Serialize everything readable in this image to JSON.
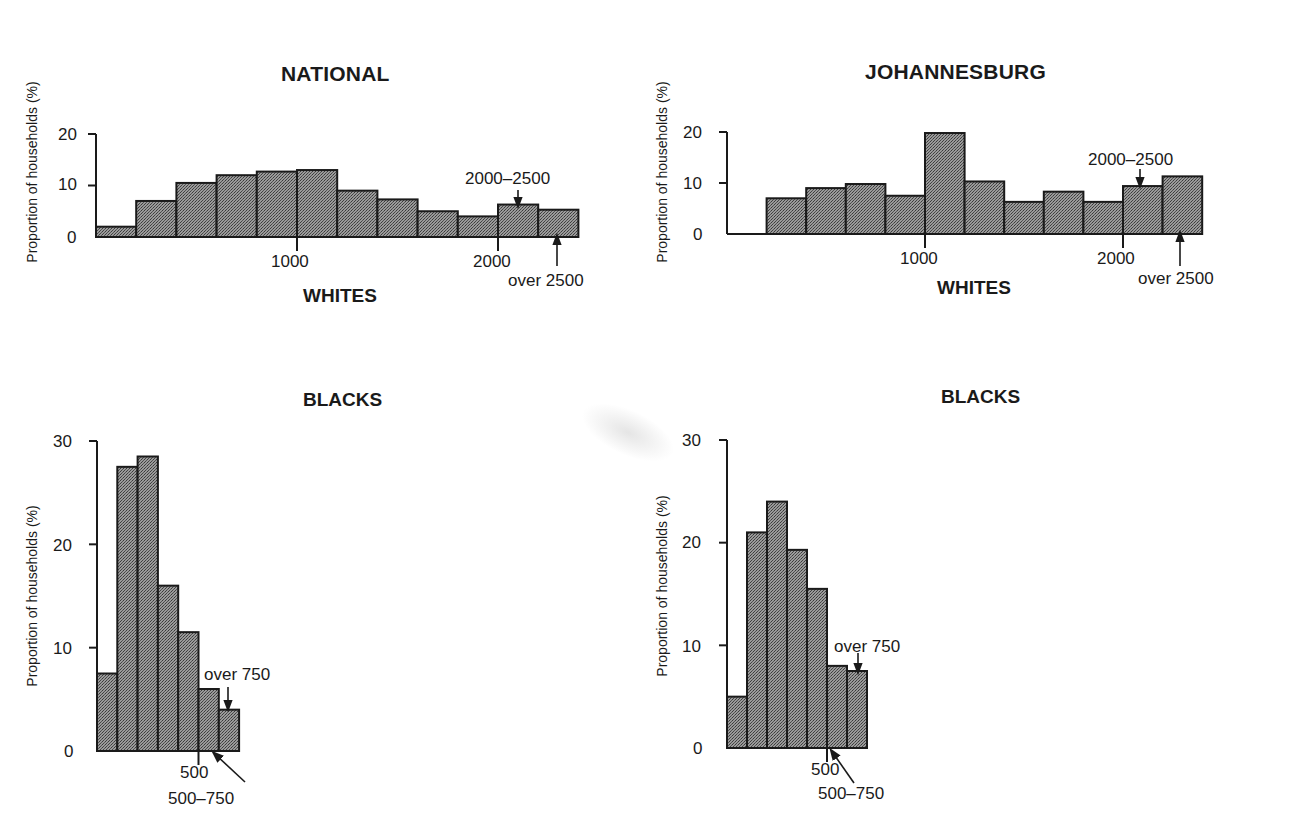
{
  "page": {
    "col_headers": {
      "national": "NATIONAL",
      "johannesburg": "JOHANNESBURG"
    },
    "ylabel": "Proportion of households (%)",
    "fill_color": "#8c8c8c",
    "line_color": "#1a1a1a"
  },
  "chart_data": [
    {
      "id": "national_whites",
      "type": "bar",
      "title": "NATIONAL",
      "xlabel": "WHITES",
      "ylabel": "Proportion of households (%)",
      "categories": [
        "0-200",
        "200-400",
        "400-600",
        "600-800",
        "800-1000",
        "1000-1200",
        "1200-1400",
        "1400-1600",
        "1600-1800",
        "1800-2000",
        "2000-2500",
        "over 2500"
      ],
      "values": [
        2,
        7,
        10.5,
        12,
        12.7,
        13,
        9,
        7.3,
        5,
        4,
        6.3,
        5.3
      ],
      "ylim": [
        0,
        20
      ],
      "yticks": [
        0,
        10,
        20
      ],
      "xticks": [
        1000,
        2000
      ],
      "annotations": [
        "2000–2500",
        "over 2500"
      ],
      "grid": false
    },
    {
      "id": "johannesburg_whites",
      "type": "bar",
      "title": "JOHANNESBURG",
      "xlabel": "WHITES",
      "ylabel": "Proportion of households (%)",
      "categories": [
        "0-200",
        "200-400",
        "400-600",
        "600-800",
        "800-1000",
        "1000-1200",
        "1200-1400",
        "1400-1600",
        "1600-1800",
        "1800-2000",
        "2000-2500",
        "over 2500"
      ],
      "values": [
        0,
        7,
        9,
        9.8,
        7.5,
        19.8,
        10.3,
        6.3,
        8.3,
        6.3,
        9.4,
        11.3
      ],
      "ylim": [
        0,
        20
      ],
      "yticks": [
        0,
        10,
        20
      ],
      "xticks": [
        1000,
        2000
      ],
      "annotations": [
        "2000–2500",
        "over 2500"
      ],
      "grid": false
    },
    {
      "id": "national_blacks",
      "type": "bar",
      "title": "BLACKS",
      "ylabel": "Proportion of households (%)",
      "categories": [
        "0-100",
        "100-200",
        "200-300",
        "300-400",
        "400-500",
        "500-750",
        "over 750"
      ],
      "values": [
        7.5,
        27.5,
        28.5,
        16,
        11.5,
        6,
        4
      ],
      "ylim": [
        0,
        30
      ],
      "yticks": [
        0,
        10,
        20,
        30
      ],
      "xticks": [
        500
      ],
      "annotations": [
        "over 750",
        "500–750"
      ],
      "grid": false
    },
    {
      "id": "johannesburg_blacks",
      "type": "bar",
      "title": "BLACKS",
      "ylabel": "Proportion of households (%)",
      "categories": [
        "0-100",
        "100-200",
        "200-300",
        "300-400",
        "400-500",
        "500-750",
        "over 750"
      ],
      "values": [
        5,
        21,
        24,
        19.3,
        15.5,
        8,
        7.5
      ],
      "ylim": [
        0,
        30
      ],
      "yticks": [
        0,
        10,
        20,
        30
      ],
      "xticks": [
        500
      ],
      "annotations": [
        "over 750",
        "500–750"
      ],
      "grid": false
    }
  ],
  "labels": {
    "nw": {
      "title": "NATIONAL",
      "xlabel": "WHITES",
      "y0": "0",
      "y10": "10",
      "y20": "20",
      "x1000": "1000",
      "x2000": "2000",
      "a1": "2000–2500",
      "a2": "over 2500"
    },
    "jw": {
      "title": "JOHANNESBURG",
      "xlabel": "WHITES",
      "y0": "0",
      "y10": "10",
      "y20": "20",
      "x1000": "1000",
      "x2000": "2000",
      "a1": "2000–2500",
      "a2": "over 2500"
    },
    "nb": {
      "title": "BLACKS",
      "y0": "0",
      "y10": "10",
      "y20": "20",
      "y30": "30",
      "x500": "500",
      "a1": "over 750",
      "a2": "500–750"
    },
    "jb": {
      "title": "BLACKS",
      "y0": "0",
      "y10": "10",
      "y20": "20",
      "y30": "30",
      "x500": "500",
      "a1": "over 750",
      "a2": "500–750"
    }
  }
}
